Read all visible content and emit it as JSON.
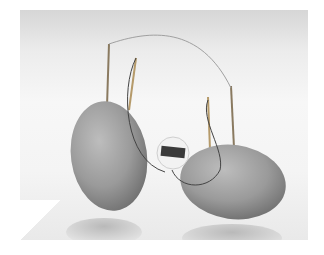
{
  "image": {
    "description": "Potato battery: two potatoes with electrodes wired to a small digital clock",
    "subjects": [
      "left potato",
      "right potato",
      "digital clock",
      "copper wire",
      "zinc electrodes"
    ],
    "clock_display": "12:03"
  }
}
